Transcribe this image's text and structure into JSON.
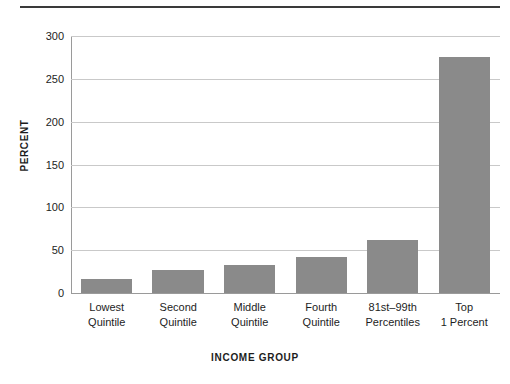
{
  "chart_data": {
    "type": "bar",
    "title": "",
    "subtitle": "",
    "xlabel": "INCOME GROUP",
    "ylabel": "PERCENT",
    "categories": [
      "Lowest Quintile",
      "Second Quintile",
      "Middle Quintile",
      "Fourth Quintile",
      "81st–99th Percentiles",
      "Top 1 Percent"
    ],
    "category_lines": [
      [
        "Lowest",
        "Quintile"
      ],
      [
        "Second",
        "Quintile"
      ],
      [
        "Middle",
        "Quintile"
      ],
      [
        "Fourth",
        "Quintile"
      ],
      [
        "81st–99th",
        "Percentiles"
      ],
      [
        "Top",
        "1 Percent"
      ]
    ],
    "values": [
      16,
      27,
      33,
      42,
      62,
      275
    ],
    "ylim": [
      0,
      300
    ],
    "yticks": [
      0,
      50,
      100,
      150,
      200,
      250,
      300
    ],
    "ytick_labels": [
      "0",
      "50",
      "100",
      "150",
      "200",
      "250",
      "300"
    ],
    "grid": true,
    "legend": "none",
    "bar_color": "#8a8a8a",
    "gridline_color": "#c9c9c9",
    "axis_color": "#9a9a9a",
    "rule_color": "#3a3a3a",
    "text_color": "#1d1d1d"
  }
}
